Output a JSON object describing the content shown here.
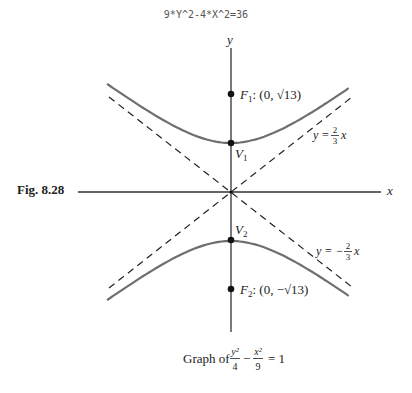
{
  "header": {
    "equation_code": "9*Y^2-4*X^2=36"
  },
  "figure": {
    "number": "Fig. 8.28",
    "caption_prefix": "Graph of",
    "caption_equation": {
      "term1_num": "y²",
      "term1_den": "4",
      "operator": "−",
      "term2_num": "x²",
      "term2_den": "9",
      "rhs": "= 1"
    }
  },
  "diagram": {
    "type": "hyperbola",
    "equation": "y^2/4 - x^2/9 = 1",
    "axes": {
      "x_label": "x",
      "y_label": "y"
    },
    "points": [
      {
        "id": "F1",
        "name": "F",
        "sub": "1",
        "coords": "(0, √13)",
        "label": "F1: (0, √13)"
      },
      {
        "id": "V1",
        "name": "V",
        "sub": "1",
        "label": "V1"
      },
      {
        "id": "V2",
        "name": "V",
        "sub": "2",
        "label": "V2"
      },
      {
        "id": "F2",
        "name": "F",
        "sub": "2",
        "coords": "(0, −√13)",
        "label": "F2: (0, −√13)"
      }
    ],
    "asymptotes": [
      {
        "id": "pos",
        "prefix": "y =",
        "num": "2",
        "den": "3",
        "suffix": "x",
        "label": "y = 2/3 x"
      },
      {
        "id": "neg",
        "prefix": "y = −",
        "num": "2",
        "den": "3",
        "suffix": "x",
        "label": "y = −2/3 x"
      }
    ],
    "colors": {
      "curve": "#6e6e6e",
      "axes": "#333333",
      "asymptote": "#222222",
      "point": "#111111"
    }
  }
}
